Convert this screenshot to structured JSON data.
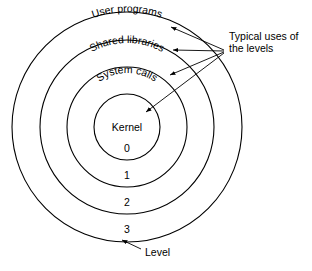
{
  "figure": {
    "type": "concentric-ring-diagram",
    "background": "#ffffff",
    "stroke_color": "#000000"
  },
  "rings": [
    {
      "level": "0",
      "label": "Kernel",
      "radius": 33,
      "level_number_y": 152
    },
    {
      "level": "1",
      "label": "System calls",
      "radius": 60,
      "level_number_y": 178
    },
    {
      "level": "2",
      "label": "Shared libraries",
      "radius": 87,
      "level_number_y": 205
    },
    {
      "level": "3",
      "label": "User programs",
      "radius": 115,
      "level_number_y": 232
    }
  ],
  "center_label": "Kernel",
  "curved_labels": [
    {
      "text": "User programs",
      "ring": 3
    },
    {
      "text": "Shared libraries",
      "ring": 2
    },
    {
      "text": "System calls",
      "ring": 1
    }
  ],
  "level_numbers": [
    "0",
    "1",
    "2",
    "3"
  ],
  "annotations": {
    "uses_line1": "Typical uses of",
    "uses_line2": "the levels",
    "level_caption": "Level"
  }
}
